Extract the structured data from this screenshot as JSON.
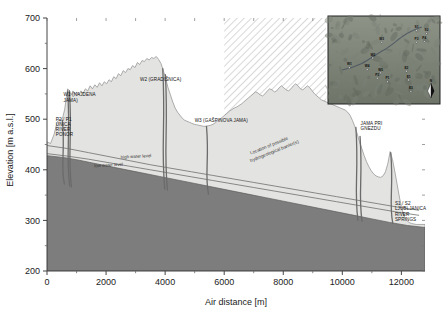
{
  "figure": {
    "type": "hydrogeological-cross-section",
    "background": "#ffffff"
  },
  "chart_data": {
    "type": "area",
    "title": "",
    "xlabel": "Air distance [m]",
    "ylabel": "Elevation [m a.s.l.]",
    "xlim": [
      0,
      12800
    ],
    "ylim": [
      200,
      700
    ],
    "xticks": [
      0,
      2000,
      4000,
      6000,
      8000,
      10000,
      12000
    ],
    "xtick_labels": [
      "0",
      "2000",
      "4000",
      "6000",
      "8000",
      "10000",
      "12000"
    ],
    "yticks": [
      200,
      300,
      400,
      500,
      600,
      700
    ],
    "ytick_labels": [
      "200",
      "300",
      "400",
      "500",
      "600",
      "700"
    ],
    "minor_xticks": [
      1000,
      3000,
      5000,
      7000,
      9000,
      11000
    ],
    "minor_yticks": [
      250,
      350,
      450,
      550,
      650
    ],
    "grid": false,
    "legend": null,
    "series": [
      {
        "name": "Surface topography",
        "kind": "area",
        "fill": "#e3e3e1",
        "stroke": "#8c8c8c",
        "points": [
          [
            0,
            455
          ],
          [
            120,
            452
          ],
          [
            240,
            470
          ],
          [
            330,
            492
          ],
          [
            400,
            500
          ],
          [
            470,
            498
          ],
          [
            540,
            505
          ],
          [
            600,
            520
          ],
          [
            660,
            545
          ],
          [
            700,
            560
          ],
          [
            760,
            556
          ],
          [
            820,
            548
          ],
          [
            880,
            556
          ],
          [
            950,
            549
          ],
          [
            1010,
            554
          ],
          [
            1080,
            548
          ],
          [
            1150,
            556
          ],
          [
            1220,
            551
          ],
          [
            1300,
            560
          ],
          [
            1380,
            556
          ],
          [
            1460,
            566
          ],
          [
            1540,
            560
          ],
          [
            1620,
            568
          ],
          [
            1700,
            563
          ],
          [
            1780,
            572
          ],
          [
            1860,
            566
          ],
          [
            1940,
            574
          ],
          [
            2020,
            570
          ],
          [
            2100,
            578
          ],
          [
            2180,
            574
          ],
          [
            2260,
            584
          ],
          [
            2340,
            580
          ],
          [
            2420,
            590
          ],
          [
            2500,
            586
          ],
          [
            2580,
            596
          ],
          [
            2660,
            592
          ],
          [
            2740,
            600
          ],
          [
            2820,
            598
          ],
          [
            2900,
            606
          ],
          [
            2980,
            602
          ],
          [
            3060,
            612
          ],
          [
            3140,
            608
          ],
          [
            3220,
            616
          ],
          [
            3300,
            614
          ],
          [
            3380,
            620
          ],
          [
            3460,
            617
          ],
          [
            3540,
            622
          ],
          [
            3620,
            620
          ],
          [
            3700,
            624
          ],
          [
            3780,
            618
          ],
          [
            3860,
            610
          ],
          [
            3940,
            596
          ],
          [
            4020,
            580
          ],
          [
            4100,
            562
          ],
          [
            4180,
            548
          ],
          [
            4260,
            534
          ],
          [
            4340,
            522
          ],
          [
            4420,
            514
          ],
          [
            4500,
            508
          ],
          [
            4580,
            502
          ],
          [
            4660,
            498
          ],
          [
            4740,
            496
          ],
          [
            4820,
            494
          ],
          [
            4900,
            492
          ],
          [
            4980,
            490
          ],
          [
            5060,
            489
          ],
          [
            5140,
            488
          ],
          [
            5220,
            487
          ],
          [
            5300,
            486
          ],
          [
            5380,
            486
          ],
          [
            5460,
            487
          ],
          [
            5540,
            488
          ],
          [
            5620,
            490
          ],
          [
            5700,
            493
          ],
          [
            5780,
            497
          ],
          [
            5860,
            500
          ],
          [
            5940,
            504
          ],
          [
            6020,
            508
          ],
          [
            6100,
            512
          ],
          [
            6180,
            516
          ],
          [
            6260,
            519
          ],
          [
            6340,
            522
          ],
          [
            6420,
            524
          ],
          [
            6500,
            527
          ],
          [
            6580,
            530
          ],
          [
            6660,
            534
          ],
          [
            6740,
            538
          ],
          [
            6820,
            542
          ],
          [
            6900,
            546
          ],
          [
            6980,
            550
          ],
          [
            7060,
            554
          ],
          [
            7140,
            552
          ],
          [
            7220,
            548
          ],
          [
            7300,
            546
          ],
          [
            7380,
            550
          ],
          [
            7460,
            556
          ],
          [
            7540,
            560
          ],
          [
            7620,
            558
          ],
          [
            7700,
            554
          ],
          [
            7780,
            556
          ],
          [
            7860,
            562
          ],
          [
            7940,
            566
          ],
          [
            8020,
            562
          ],
          [
            8100,
            558
          ],
          [
            8180,
            556
          ],
          [
            8260,
            560
          ],
          [
            8340,
            566
          ],
          [
            8420,
            570
          ],
          [
            8500,
            566
          ],
          [
            8580,
            560
          ],
          [
            8660,
            558
          ],
          [
            8740,
            562
          ],
          [
            8820,
            566
          ],
          [
            8900,
            562
          ],
          [
            8980,
            556
          ],
          [
            9060,
            550
          ],
          [
            9140,
            546
          ],
          [
            9220,
            542
          ],
          [
            9300,
            538
          ],
          [
            9380,
            536
          ],
          [
            9460,
            534
          ],
          [
            9540,
            532
          ],
          [
            9620,
            530
          ],
          [
            9700,
            528
          ],
          [
            9780,
            526
          ],
          [
            9860,
            524
          ],
          [
            9940,
            522
          ],
          [
            10020,
            520
          ],
          [
            10100,
            518
          ],
          [
            10180,
            514
          ],
          [
            10260,
            508
          ],
          [
            10340,
            498
          ],
          [
            10420,
            486
          ],
          [
            10500,
            472
          ],
          [
            10580,
            456
          ],
          [
            10660,
            442
          ],
          [
            10740,
            428
          ],
          [
            10820,
            416
          ],
          [
            10900,
            406
          ],
          [
            10980,
            398
          ],
          [
            11060,
            392
          ],
          [
            11140,
            388
          ],
          [
            11220,
            386
          ],
          [
            11300,
            385
          ],
          [
            11380,
            388
          ],
          [
            11460,
            396
          ],
          [
            11540,
            412
          ],
          [
            11620,
            436
          ],
          [
            11700,
            420
          ],
          [
            11780,
            396
          ],
          [
            11860,
            370
          ],
          [
            11940,
            344
          ],
          [
            12020,
            322
          ],
          [
            12100,
            308
          ],
          [
            12180,
            300
          ],
          [
            12260,
            296
          ],
          [
            12340,
            294
          ],
          [
            12420,
            293
          ],
          [
            12500,
            292
          ],
          [
            12600,
            292
          ],
          [
            12700,
            292
          ],
          [
            12800,
            292
          ]
        ]
      },
      {
        "name": "Saturated / impermeable basement",
        "kind": "area",
        "fill": "#7d7d7d",
        "stroke": "#5a5a5a",
        "points": [
          [
            0,
            428
          ],
          [
            600,
            424
          ],
          [
            1000,
            420
          ],
          [
            1500,
            414
          ],
          [
            2000,
            408
          ],
          [
            2600,
            401
          ],
          [
            3200,
            394
          ],
          [
            3800,
            387
          ],
          [
            4400,
            380
          ],
          [
            5000,
            373
          ],
          [
            5600,
            366
          ],
          [
            6200,
            359
          ],
          [
            6800,
            352
          ],
          [
            7400,
            345
          ],
          [
            8000,
            338
          ],
          [
            8600,
            331
          ],
          [
            9200,
            324
          ],
          [
            9800,
            317
          ],
          [
            10400,
            310
          ],
          [
            11000,
            303
          ],
          [
            11600,
            296
          ],
          [
            12200,
            290
          ],
          [
            12800,
            286
          ]
        ]
      },
      {
        "name": "high water level",
        "kind": "line",
        "stroke": "#6f6f6f",
        "label": "high water level",
        "points": [
          [
            0,
            448
          ],
          [
            700,
            442
          ],
          [
            1400,
            434
          ],
          [
            2100,
            426
          ],
          [
            2800,
            418
          ],
          [
            3500,
            410
          ],
          [
            4200,
            403
          ],
          [
            4900,
            396
          ],
          [
            5600,
            389
          ],
          [
            6300,
            382
          ],
          [
            7000,
            375
          ],
          [
            7700,
            368
          ],
          [
            8400,
            361
          ],
          [
            9100,
            354
          ],
          [
            9800,
            347
          ],
          [
            10500,
            340
          ],
          [
            11200,
            333
          ],
          [
            11900,
            326
          ],
          [
            12600,
            320
          ]
        ]
      },
      {
        "name": "low water level",
        "kind": "line",
        "stroke": "#6f6f6f",
        "label": "low water level",
        "points": [
          [
            0,
            432
          ],
          [
            700,
            427
          ],
          [
            1400,
            421
          ],
          [
            2100,
            414
          ],
          [
            2800,
            407
          ],
          [
            3500,
            400
          ],
          [
            4200,
            393
          ],
          [
            4900,
            386
          ],
          [
            5600,
            379
          ],
          [
            6300,
            372
          ],
          [
            7000,
            365
          ],
          [
            7700,
            358
          ],
          [
            8400,
            351
          ],
          [
            9100,
            344
          ],
          [
            9800,
            337
          ],
          [
            10500,
            330
          ],
          [
            11200,
            323
          ],
          [
            11900,
            316
          ],
          [
            12600,
            310
          ]
        ]
      }
    ],
    "shafts": [
      {
        "name": "P2 / P1 Unica River ponor",
        "x": 520,
        "top": 498,
        "bottom": 372
      },
      {
        "name": "W1 Najdena jama",
        "x": 700,
        "top": 556,
        "bottom": 368
      },
      {
        "name": "W1 Najdena jama b",
        "x": 760,
        "top": 556,
        "bottom": 366
      },
      {
        "name": "W2 Gradisnica",
        "x": 3920,
        "top": 600,
        "bottom": 362
      },
      {
        "name": "W2 Gradisnica b",
        "x": 4010,
        "top": 588,
        "bottom": 360
      },
      {
        "name": "W3 Gaspinova jama",
        "x": 5400,
        "top": 486,
        "bottom": 352
      },
      {
        "name": "Jama pri Gnezdu",
        "x": 10460,
        "top": 484,
        "bottom": 300
      },
      {
        "name": "Jama pri Gnezdu b",
        "x": 10600,
        "top": 466,
        "bottom": 298
      },
      {
        "name": "S1 / S2 springs",
        "x": 11640,
        "top": 434,
        "bottom": 294
      }
    ],
    "barrier_zone": {
      "label": "Location of possible hydrogeological barrier(s)",
      "x_start": 6000,
      "x_end": 9450,
      "hatch": true
    },
    "annotations": [
      {
        "id": "P2P1",
        "text_lines": [
          "P2 / P1",
          "UNICA",
          "RIVER",
          "PONOR"
        ],
        "x": 300,
        "y": 497
      },
      {
        "id": "W1",
        "text_lines": [
          "W1 (NAJDENA",
          "JAMA)"
        ],
        "x": 560,
        "y": 545
      },
      {
        "id": "W2",
        "text_lines": [
          "W2 (GRADIŠNICA)"
        ],
        "x": 3150,
        "y": 575
      },
      {
        "id": "W3",
        "text_lines": [
          "W3 (GAŠPINOVA JAMA)"
        ],
        "x": 5000,
        "y": 495
      },
      {
        "id": "JPG",
        "text_lines": [
          "JAMA PRI",
          "GNEZDU"
        ],
        "x": 10620,
        "y": 488
      },
      {
        "id": "S1S2",
        "text_lines": [
          "S1 / S2",
          "LJUBLJANICA",
          "RIVER",
          "SPRINGS"
        ],
        "x": 11780,
        "y": 330
      }
    ]
  },
  "inset_map": {
    "title": "",
    "north_arrow": "N",
    "points": [
      {
        "label": "W1",
        "x": 0.19,
        "y": 0.56
      },
      {
        "label": "W2",
        "x": 0.4,
        "y": 0.45
      },
      {
        "label": "W3",
        "x": 0.48,
        "y": 0.27
      },
      {
        "label": "W4",
        "x": 0.35,
        "y": 0.58
      },
      {
        "label": "W5",
        "x": 0.47,
        "y": 0.62
      },
      {
        "label": "P2",
        "x": 0.44,
        "y": 0.68
      },
      {
        "label": "P1",
        "x": 0.53,
        "y": 0.72
      },
      {
        "label": "E2",
        "x": 0.7,
        "y": 0.6
      },
      {
        "label": "E1",
        "x": 0.72,
        "y": 0.7
      },
      {
        "label": "E3",
        "x": 0.74,
        "y": 0.83
      },
      {
        "label": "S1",
        "x": 0.79,
        "y": 0.14
      },
      {
        "label": "S2",
        "x": 0.88,
        "y": 0.17
      },
      {
        "label": "P3",
        "x": 0.79,
        "y": 0.27
      },
      {
        "label": "P4",
        "x": 0.86,
        "y": 0.26
      }
    ]
  }
}
